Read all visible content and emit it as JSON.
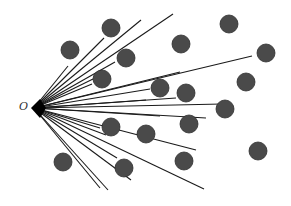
{
  "diagram": {
    "origin_label": "O",
    "origin": [
      34,
      108
    ],
    "colors": {
      "line": "#1a1a1a",
      "circle": "#4a4a4a",
      "circle_edge": "#2e2e2e",
      "background": "#ffffff"
    },
    "circle_radius": 9,
    "rays": [
      [
        68,
        66
      ],
      [
        104,
        38
      ],
      [
        141,
        20
      ],
      [
        173,
        14
      ],
      [
        115,
        62
      ],
      [
        93,
        79
      ],
      [
        92,
        84
      ],
      [
        180,
        72
      ],
      [
        150,
        89
      ],
      [
        252,
        56
      ],
      [
        146,
        100
      ],
      [
        176,
        98
      ],
      [
        222,
        104
      ],
      [
        206,
        118
      ],
      [
        160,
        116
      ],
      [
        100,
        128
      ],
      [
        106,
        135
      ],
      [
        196,
        150
      ],
      [
        117,
        158
      ],
      [
        131,
        180
      ],
      [
        100,
        188
      ],
      [
        108,
        190
      ],
      [
        204,
        189
      ]
    ],
    "circles": [
      [
        70,
        50
      ],
      [
        111,
        28
      ],
      [
        126,
        58
      ],
      [
        102,
        79
      ],
      [
        181,
        44
      ],
      [
        229,
        24
      ],
      [
        266,
        53
      ],
      [
        160,
        88
      ],
      [
        186,
        93
      ],
      [
        246,
        82
      ],
      [
        225,
        109
      ],
      [
        111,
        127
      ],
      [
        146,
        134
      ],
      [
        189,
        124
      ],
      [
        63,
        162
      ],
      [
        124,
        168
      ],
      [
        184,
        161
      ],
      [
        258,
        151
      ]
    ]
  }
}
